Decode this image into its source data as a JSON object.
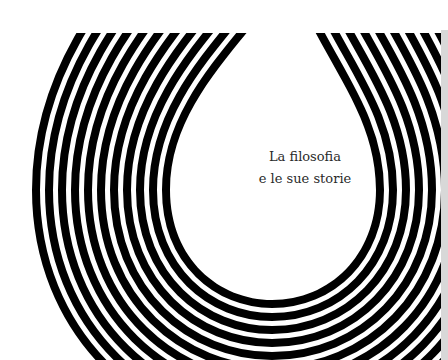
{
  "cover": {
    "title_line_1": "La filosofia",
    "title_line_2": "e le sue storie",
    "background_color": "#ffffff",
    "stripe_color": "#000000",
    "motif": "concentric-striped-teardrop"
  }
}
